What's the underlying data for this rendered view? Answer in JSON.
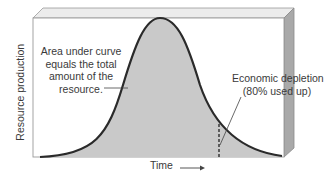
{
  "diagram": {
    "type": "bell-curve-resource-depletion",
    "y_axis_label": "Resource production",
    "x_axis_label": "Time",
    "x_axis_arrow": "→",
    "annotations": {
      "area": "Area under curve equals the total amount of the resource.",
      "area_lines": [
        "Area under curve",
        "equals the total",
        "amount of the",
        "resource."
      ],
      "depletion_lines": [
        "Economic depletion",
        "(80% used up)"
      ]
    },
    "colors": {
      "fill": "#c8c8c8",
      "curve": "#2a2a2a",
      "panel": "#ffffff",
      "bevel_side": "#a8a8a8",
      "bevel_top": "#e6e6e6",
      "text": "#3a3a3a"
    }
  }
}
